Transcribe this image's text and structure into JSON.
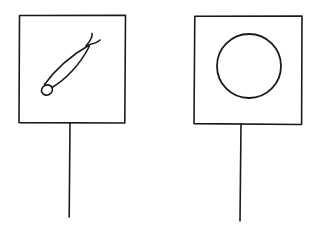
{
  "figure": {
    "ink_color": "#1a1a1a",
    "background": "#ffffff"
  },
  "signs": [
    {
      "id": "left",
      "symbol": "elongated pod shape with small loop end and crossed tips",
      "board": {
        "x": 19,
        "y": 15,
        "w": 106,
        "h": 108
      },
      "post": {
        "x1": 70,
        "y1": 123,
        "x2": 69,
        "y2": 217
      }
    },
    {
      "id": "right",
      "symbol": "circle",
      "board": {
        "x": 194,
        "y": 16,
        "w": 108,
        "h": 108
      },
      "circle": {
        "cx": 249,
        "cy": 66,
        "r": 32
      },
      "post": {
        "x1": 241,
        "y1": 124,
        "x2": 240,
        "y2": 221
      }
    }
  ]
}
